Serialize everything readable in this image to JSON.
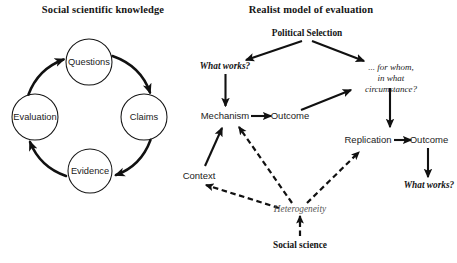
{
  "left_panel": {
    "title": "Social scientific knowledge",
    "type": "cycle-diagram",
    "nodes": [
      {
        "id": "questions",
        "label": "Questions",
        "cx": 89,
        "cy": 62,
        "r": 23
      },
      {
        "id": "claims",
        "label": "Claims",
        "cx": 144,
        "cy": 117,
        "r": 23
      },
      {
        "id": "evidence",
        "label": "Evidence",
        "cx": 90,
        "cy": 171,
        "r": 22
      },
      {
        "id": "evaluation",
        "label": "Evaluation",
        "cx": 35,
        "cy": 117,
        "r": 23
      }
    ],
    "edges": [
      {
        "from": "evaluation",
        "to": "questions",
        "style": "solid-curved"
      },
      {
        "from": "questions",
        "to": "claims",
        "style": "solid-curved"
      },
      {
        "from": "claims",
        "to": "evidence",
        "style": "solid-curved"
      },
      {
        "from": "evidence",
        "to": "evaluation",
        "style": "solid-curved"
      }
    ]
  },
  "right_panel": {
    "title": "Realist model of evaluation",
    "type": "flow-diagram",
    "nodes": [
      {
        "id": "political-selection",
        "label": "Political Selection",
        "style": "serif-bold"
      },
      {
        "id": "what-works-1",
        "label": "What works?",
        "style": "bold-italic"
      },
      {
        "id": "for-whom",
        "label": "... for whom,\nin what\ncircumstance?",
        "style": "italic",
        "lines": [
          "... for whom,",
          "in what",
          "circumstance?"
        ]
      },
      {
        "id": "mechanism",
        "label": "Mechanism",
        "style": "sans"
      },
      {
        "id": "outcome-1",
        "label": "Outcome",
        "style": "sans"
      },
      {
        "id": "replication",
        "label": "Replication",
        "style": "sans"
      },
      {
        "id": "outcome-2",
        "label": "Outcome",
        "style": "sans"
      },
      {
        "id": "context",
        "label": "Context",
        "style": "sans"
      },
      {
        "id": "heterogeneity",
        "label": "Heterogeneity",
        "style": "italic-gray"
      },
      {
        "id": "social-science",
        "label": "Social science",
        "style": "serif-bold"
      },
      {
        "id": "what-works-2",
        "label": "What works?",
        "style": "bold-italic"
      }
    ],
    "edges": [
      {
        "from": "political-selection",
        "to": "what-works-1",
        "style": "solid"
      },
      {
        "from": "political-selection",
        "to": "for-whom",
        "style": "solid"
      },
      {
        "from": "what-works-1",
        "to": "mechanism",
        "style": "solid"
      },
      {
        "from": "mechanism",
        "to": "outcome-1",
        "style": "solid"
      },
      {
        "from": "outcome-1",
        "to": "for-whom",
        "style": "solid"
      },
      {
        "from": "for-whom",
        "to": "replication",
        "style": "solid"
      },
      {
        "from": "replication",
        "to": "outcome-2",
        "style": "solid"
      },
      {
        "from": "outcome-2",
        "to": "what-works-2",
        "style": "solid"
      },
      {
        "from": "context",
        "to": "mechanism",
        "style": "solid"
      },
      {
        "from": "heterogeneity",
        "to": "mechanism",
        "style": "dashed"
      },
      {
        "from": "heterogeneity",
        "to": "context",
        "style": "dashed"
      },
      {
        "from": "heterogeneity",
        "to": "replication",
        "style": "dashed"
      },
      {
        "from": "social-science",
        "to": "heterogeneity",
        "style": "dashed"
      }
    ]
  },
  "colors": {
    "background": "#ffffff",
    "stroke": "#111111",
    "text": "#1a1a1a",
    "muted_text": "#565656"
  }
}
